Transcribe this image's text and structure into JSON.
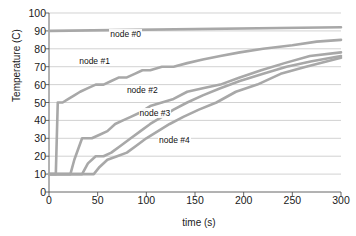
{
  "chart_data": {
    "type": "line",
    "title": "",
    "xlabel": "time (s)",
    "ylabel": "Temperature (C)",
    "xlim": [
      0,
      300
    ],
    "ylim": [
      0,
      100
    ],
    "grid": true,
    "legend_position": "inline-annotations",
    "xticks": [
      0,
      50,
      100,
      150,
      200,
      250,
      300
    ],
    "yticks": [
      0,
      10,
      20,
      30,
      40,
      50,
      60,
      70,
      80,
      90,
      100
    ],
    "line_color": "#a8a8a8",
    "series": [
      {
        "name": "node #0",
        "label_x": 62,
        "label_y": 88,
        "x": [
          0,
          2,
          300
        ],
        "values": [
          90,
          90,
          92
        ]
      },
      {
        "name": "node #1",
        "label_x": 30,
        "label_y": 73,
        "x": [
          0,
          7,
          9,
          14,
          20,
          26,
          32,
          40,
          48,
          56,
          64,
          72,
          80,
          88,
          96,
          104,
          116,
          128,
          142,
          158,
          176,
          196,
          220,
          250,
          275,
          300
        ],
        "values": [
          10,
          10,
          50,
          50,
          52,
          54,
          56,
          58,
          60,
          60,
          62,
          64,
          64,
          66,
          68,
          68,
          70,
          70,
          72,
          74,
          76,
          78,
          80,
          82,
          84,
          85
        ]
      },
      {
        "name": "node #2",
        "label_x": 79,
        "label_y": 57,
        "x": [
          0,
          22,
          26,
          34,
          44,
          52,
          60,
          68,
          76,
          84,
          92,
          104,
          116,
          128,
          142,
          158,
          176,
          196,
          218,
          242,
          268,
          300
        ],
        "values": [
          10,
          10,
          18,
          30,
          30,
          32,
          34,
          38,
          40,
          42,
          44,
          48,
          50,
          52,
          56,
          58,
          60,
          64,
          68,
          72,
          76,
          78
        ]
      },
      {
        "name": "node #3",
        "label_x": 92,
        "label_y": 44,
        "x": [
          0,
          34,
          40,
          48,
          56,
          64,
          74,
          84,
          94,
          104,
          116,
          128,
          142,
          158,
          176,
          196,
          220,
          244,
          270,
          300
        ],
        "values": [
          10,
          10,
          16,
          20,
          20,
          22,
          26,
          30,
          34,
          38,
          42,
          46,
          50,
          54,
          58,
          62,
          66,
          70,
          73,
          76
        ]
      },
      {
        "name": "node #4",
        "label_x": 112,
        "label_y": 29,
        "x": [
          0,
          46,
          52,
          60,
          70,
          80,
          90,
          100,
          112,
          124,
          138,
          154,
          172,
          192,
          214,
          238,
          264,
          300
        ],
        "values": [
          10,
          10,
          14,
          18,
          20,
          22,
          26,
          30,
          34,
          38,
          42,
          46,
          50,
          56,
          60,
          66,
          70,
          75
        ]
      }
    ]
  }
}
